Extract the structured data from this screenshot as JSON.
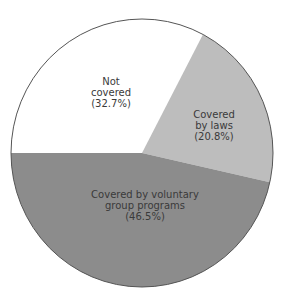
{
  "chart_data": {
    "type": "pie",
    "title": "",
    "slices": [
      {
        "label": "Not covered",
        "lines": [
          "Not",
          "covered",
          "(32.7%)"
        ],
        "value": 32.7,
        "color": "#ffffff"
      },
      {
        "label": "Covered by laws",
        "lines": [
          "Covered",
          "by laws",
          "(20.8%)"
        ],
        "value": 20.8,
        "color": "#bdbdbd"
      },
      {
        "label": "Covered by voluntary group programs",
        "lines": [
          "Covered by voluntary",
          "group programs",
          "(46.5%)"
        ],
        "value": 46.5,
        "color": "#8c8c8c"
      }
    ],
    "start_angle_deg": 180,
    "direction": "clockwise",
    "legend": "none",
    "labels_inside": true
  }
}
